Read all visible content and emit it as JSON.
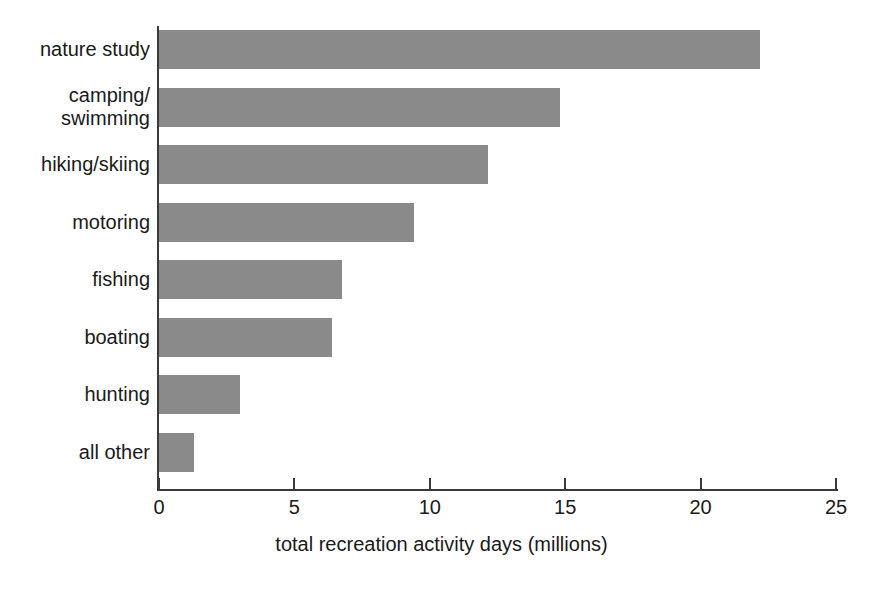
{
  "chart_data": {
    "type": "bar",
    "orientation": "horizontal",
    "title": "",
    "xlabel": "total recreation activity days (millions)",
    "ylabel": "",
    "xlim": [
      0,
      25
    ],
    "xticks": [
      "0",
      "5",
      "10",
      "15",
      "20",
      "25"
    ],
    "grid": false,
    "legend": null,
    "bar_color": "#8a8a8a",
    "axis_color": "#3a3a3a",
    "categories": [
      "nature study",
      "camping/\nswimming",
      "hiking/skiing",
      "motoring",
      "fishing",
      "boating",
      "hunting",
      "all other"
    ],
    "category_lines": [
      [
        "nature study"
      ],
      [
        "camping/",
        "swimming"
      ],
      [
        "hiking/skiing"
      ],
      [
        "motoring"
      ],
      [
        "fishing"
      ],
      [
        "boating"
      ],
      [
        "hunting"
      ],
      [
        "all other"
      ]
    ],
    "values": [
      22.2,
      14.8,
      12.15,
      9.4,
      6.75,
      6.4,
      3.0,
      1.3
    ]
  }
}
